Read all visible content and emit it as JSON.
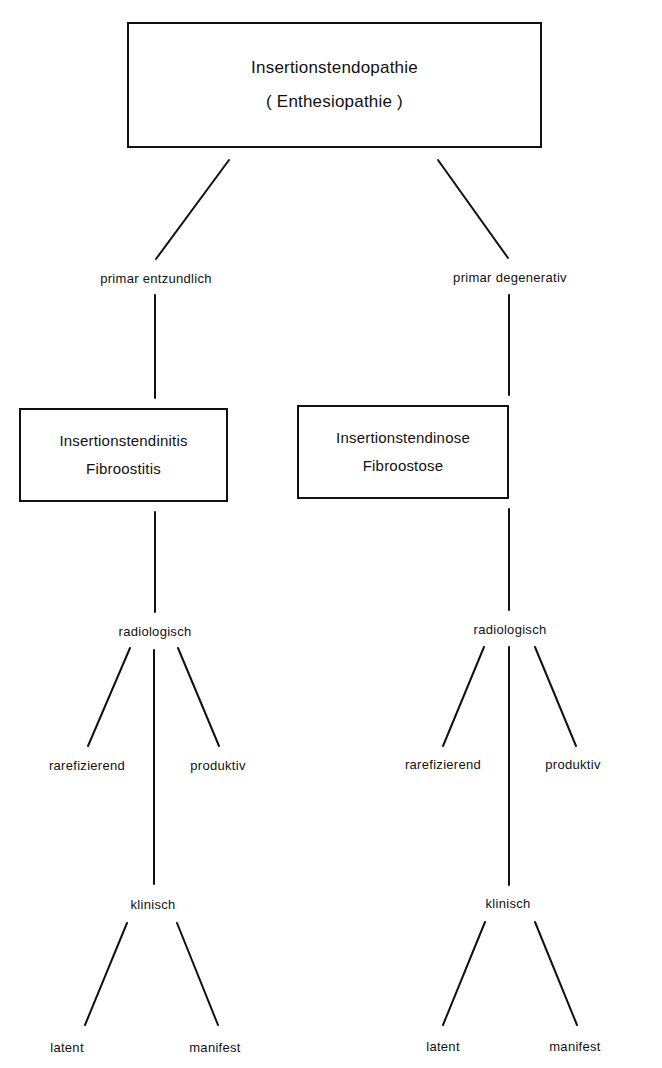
{
  "root": {
    "line1": "Insertionstendopathie",
    "line2": "( Enthesiopathie )"
  },
  "branches": [
    {
      "connector_label": "primar entzundlich",
      "box": {
        "line1": "Insertionstendinitis",
        "line2": "Fibroostitis"
      },
      "radiological": {
        "label": "radiologisch",
        "children": [
          "rarefizierend",
          "produktiv"
        ]
      },
      "clinical": {
        "label": "klinisch",
        "children": [
          "latent",
          "manifest"
        ]
      }
    },
    {
      "connector_label": "primar degenerativ",
      "box": {
        "line1": "Insertionstendinose",
        "line2": "Fibroostose"
      },
      "radiological": {
        "label": "radiologisch",
        "children": [
          "rarefizierend",
          "produktiv"
        ]
      },
      "clinical": {
        "label": "klinisch",
        "children": [
          "latent",
          "manifest"
        ]
      }
    }
  ],
  "colors": {
    "line": "#111111",
    "background": "#ffffff"
  }
}
